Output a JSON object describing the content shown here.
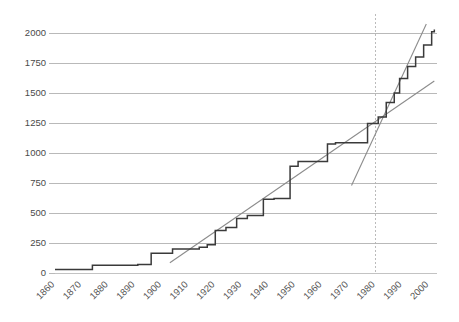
{
  "chart_data": {
    "type": "line",
    "subtype": "step",
    "title": "",
    "subtitle": "",
    "xlabel": "",
    "ylabel": "",
    "xlim": [
      1860,
      2003
    ],
    "ylim": [
      0,
      2100
    ],
    "grid": true,
    "legend": null,
    "legend_position": "none",
    "y_ticks": [
      0,
      250,
      500,
      750,
      1000,
      1250,
      1500,
      1750,
      2000
    ],
    "y_tick_labels": [
      "0",
      "250",
      "500",
      "750",
      "1000",
      "1250",
      "1500",
      "1750",
      "2000"
    ],
    "x_ticks": [
      1860,
      1870,
      1880,
      1890,
      1900,
      1910,
      1920,
      1930,
      1940,
      1950,
      1960,
      1970,
      1980,
      1990,
      2000
    ],
    "x_tick_labels": [
      "1860",
      "1870",
      "1880",
      "1890",
      "1900",
      "1910",
      "1920",
      "1930",
      "1940",
      "1950",
      "1960",
      "1970",
      "1980",
      "1990",
      "2000"
    ],
    "series": [
      {
        "name": "cumulative-step",
        "style": "step-post",
        "color": "#3a3a3a",
        "x": [
          1860,
          1873,
          1874,
          1890,
          1891,
          1895,
          1896,
          1903,
          1904,
          1913,
          1914,
          1916,
          1917,
          1919,
          1920,
          1923,
          1924,
          1927,
          1928,
          1931,
          1932,
          1937,
          1938,
          1941,
          1942,
          1947,
          1948,
          1950,
          1951,
          1961,
          1962,
          1964,
          1965,
          1976,
          1977,
          1980,
          1981,
          1983,
          1984,
          1986,
          1987,
          1988,
          1989,
          1991,
          1992,
          1994,
          1995,
          1997,
          1998,
          2000,
          2001,
          2002
        ],
        "y": [
          30,
          30,
          65,
          65,
          70,
          70,
          165,
          165,
          200,
          200,
          215,
          215,
          235,
          235,
          355,
          355,
          380,
          380,
          455,
          455,
          480,
          480,
          615,
          615,
          620,
          620,
          890,
          890,
          930,
          930,
          1075,
          1075,
          1085,
          1085,
          1245,
          1245,
          1300,
          1300,
          1420,
          1420,
          1500,
          1500,
          1620,
          1620,
          1720,
          1720,
          1800,
          1800,
          1900,
          1900,
          2010,
          2030
        ]
      }
    ],
    "trend_lines": [
      {
        "name": "early-trend",
        "color": "#8c8c8c",
        "x0": 1903,
        "y0": 85,
        "x1": 2002,
        "y1": 1600,
        "description": "long-run linear trend 1903-2002"
      },
      {
        "name": "late-trend",
        "color": "#8c8c8c",
        "x0": 1971,
        "y0": 730,
        "x1": 1999,
        "y1": 2075,
        "description": "steep post-1970 trend"
      }
    ],
    "annotations": [
      {
        "name": "regime-change-marker",
        "type": "vertical-dashed-line",
        "x": 1980,
        "color": "#b4b4b4",
        "label": ""
      }
    ],
    "intersection_note": "trend lines cross near 1983 at about 1250"
  }
}
